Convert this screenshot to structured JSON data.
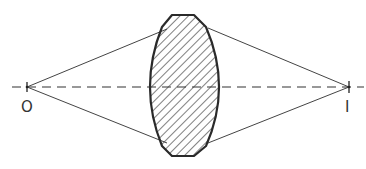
{
  "diagram": {
    "labels": {
      "object": "O",
      "image": "I"
    },
    "colors": {
      "stroke": "#2a2a2a",
      "ray": "#444444",
      "hatch": "#3a3a3a",
      "background": "#ffffff"
    },
    "elements": [
      {
        "name": "optical-axis",
        "style": "dashed"
      },
      {
        "name": "biconvex-lens",
        "fill": "diagonal-hatch"
      },
      {
        "name": "object-point",
        "label": "O"
      },
      {
        "name": "image-point",
        "label": "I"
      },
      {
        "name": "ray-upper-incident"
      },
      {
        "name": "ray-lower-incident"
      },
      {
        "name": "ray-upper-refracted"
      },
      {
        "name": "ray-lower-refracted"
      }
    ]
  }
}
